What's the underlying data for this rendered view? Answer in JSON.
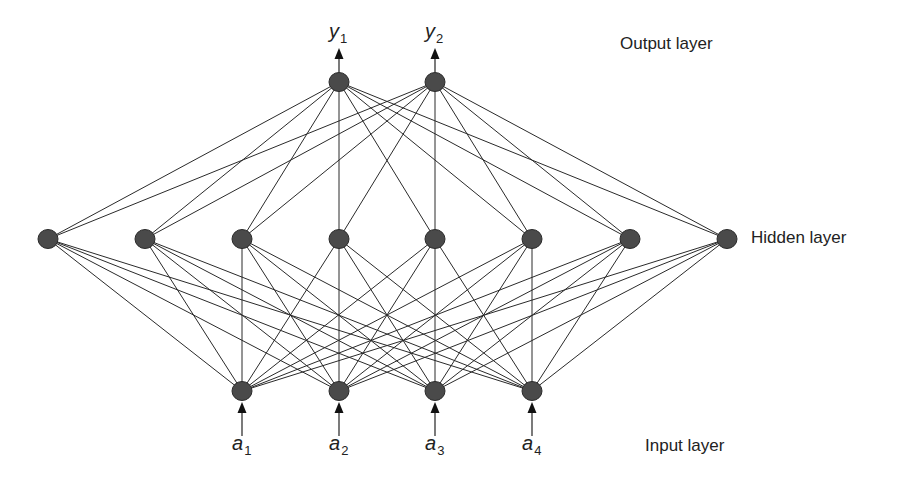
{
  "diagram": {
    "type": "feedforward-neural-network",
    "layers": {
      "output": {
        "label": "Output layer",
        "node_count": 2
      },
      "hidden": {
        "label": "Hidden layer",
        "node_count": 8
      },
      "input": {
        "label": "Input layer",
        "node_count": 4
      }
    },
    "inputs": [
      {
        "symbol": "a",
        "index": "1"
      },
      {
        "symbol": "a",
        "index": "2"
      },
      {
        "symbol": "a",
        "index": "3"
      },
      {
        "symbol": "a",
        "index": "4"
      }
    ],
    "outputs": [
      {
        "symbol": "y",
        "index": "1"
      },
      {
        "symbol": "y",
        "index": "2"
      }
    ],
    "connectivity": "fully-connected",
    "node_color": "#4a4a4a"
  },
  "geometry": {
    "output_nodes": [
      [
        339,
        82
      ],
      [
        435,
        82
      ]
    ],
    "hidden_nodes": [
      [
        48,
        239
      ],
      [
        145,
        239
      ],
      [
        242,
        239
      ],
      [
        339,
        239
      ],
      [
        435,
        239
      ],
      [
        532,
        239
      ],
      [
        630,
        239
      ],
      [
        727,
        239
      ]
    ],
    "input_nodes": [
      [
        242,
        391
      ],
      [
        339,
        391
      ],
      [
        435,
        391
      ],
      [
        532,
        391
      ]
    ],
    "node_radius": 10
  }
}
